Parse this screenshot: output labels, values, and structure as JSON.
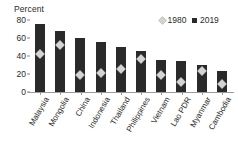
{
  "chart_data": {
    "type": "bar",
    "title": "",
    "xlabel": "",
    "ylabel": "Percent",
    "ylim": [
      0,
      80
    ],
    "yticks": [
      0,
      20,
      40,
      60,
      80
    ],
    "grid": false,
    "legend_position": "top-right",
    "categories": [
      "Malaysia",
      "Mongolia",
      "China",
      "Indonesia",
      "Thailand",
      "Philippines",
      "Vietnam",
      "Lao PDR",
      "Myanmar",
      "Cambodia"
    ],
    "series": [
      {
        "name": "1980",
        "marker": "diamond",
        "color": "#d4d4d4",
        "values": [
          42,
          52,
          19,
          21,
          26,
          37,
          19,
          11,
          23,
          9
        ]
      },
      {
        "name": "2019",
        "marker": "square",
        "color": "#2a2a2a",
        "values": [
          76,
          68,
          60,
          56,
          50,
          46,
          36,
          35,
          30,
          23
        ]
      }
    ]
  },
  "axis": {
    "y_title": "Percent",
    "y_tick_labels": [
      "80",
      "60",
      "40",
      "20",
      "0"
    ]
  },
  "legend": {
    "items": [
      {
        "label": "1980",
        "marker": "diamond-icon"
      },
      {
        "label": "2019",
        "marker": "square-icon"
      }
    ]
  }
}
